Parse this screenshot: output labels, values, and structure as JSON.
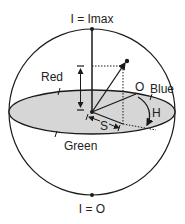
{
  "diagram": {
    "labels": {
      "top": "I = Imax",
      "bottom": "I = O",
      "red": "Red",
      "blue": "Blue",
      "green": "Green",
      "origin_o": "O",
      "hue": "H",
      "saturation": "S",
      "intensity": "I"
    },
    "colors": {
      "stroke": "#1a1a1a",
      "plane_fill": "#d6d6d6",
      "background": "#ffffff"
    }
  }
}
